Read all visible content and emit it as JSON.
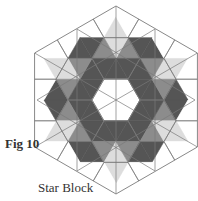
{
  "figure": {
    "label": "Fig 10",
    "caption": "Star Block",
    "colors": {
      "dark": "#555555",
      "medium": "#8c8c8c",
      "light": "#dddddd",
      "white": "#ffffff",
      "line": "#7a7a7a"
    }
  }
}
